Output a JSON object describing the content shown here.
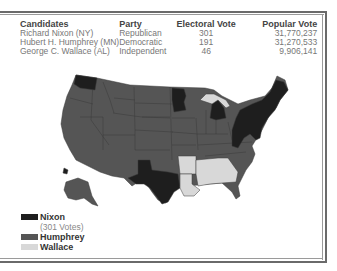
{
  "table": {
    "headers": [
      "Candidates",
      "Party",
      "Electoral Vote",
      "Popular Vote"
    ],
    "rows": [
      {
        "candidate": "Richard Nixon (NY)",
        "party": "Republican",
        "electoral": "301",
        "popular": "31,770,237"
      },
      {
        "candidate": "Hubert H. Humphrey (MN)",
        "party": "Democratic",
        "electoral": "191",
        "popular": "31,270,533"
      },
      {
        "candidate": "George C. Wallace (AL)",
        "party": "Independent",
        "electoral": "46",
        "popular": "9,906,141"
      }
    ]
  },
  "legend": {
    "items": [
      {
        "label": "Nixon",
        "sublabel": "(301 Votes)",
        "color": "#1e1e1e"
      },
      {
        "label": "Humphrey",
        "color": "#555555"
      },
      {
        "label": "Wallace",
        "color": "#d8d8d8"
      }
    ]
  },
  "map": {
    "colors": {
      "dark": "#1e1e1e",
      "medium": "#555555",
      "light": "#d8d8d8",
      "border": "#3a3a3a"
    }
  }
}
